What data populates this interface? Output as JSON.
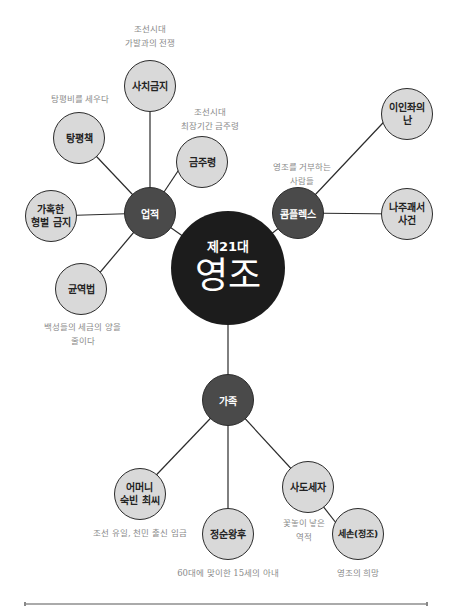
{
  "center": {
    "subtitle": "제21대",
    "title": "영조"
  },
  "hubs": {
    "achievements": "업적",
    "complex": "콤플렉스",
    "family": "가족"
  },
  "achievements": [
    {
      "label": "사치금지",
      "note": "조선시대\n가발과의 전쟁"
    },
    {
      "label": "금주령",
      "note": "조선시대\n최장기간 금주령"
    },
    {
      "label": "탕평책",
      "note": "탕평비를 세우다"
    },
    {
      "label": "가혹한\n형벌 금지",
      "note": ""
    },
    {
      "label": "균역법",
      "note": "백성들의 세금의 양을\n줄이다"
    }
  ],
  "complex": {
    "note": "영조를 거부하는\n사람들",
    "items": [
      {
        "label": "이인좌의\n난"
      },
      {
        "label": "나주괘서\n사건"
      }
    ]
  },
  "family": [
    {
      "label": "어머니\n숙빈 최씨",
      "note": "조선 유일, 천민 출신 임금"
    },
    {
      "label": "정순왕후",
      "note": "60대에 맞이한 15세의 아내"
    },
    {
      "label": "사도세자",
      "note": "꽃놓이 낳은\n역적"
    },
    {
      "label": "세손(정조)",
      "note": "영조의 희망"
    }
  ],
  "colors": {
    "leaf": "#d9d9d9",
    "hub": "#4a4a4a",
    "center": "#1c1c1c",
    "line": "#2b2b2b",
    "note": "#8a8a8a"
  }
}
